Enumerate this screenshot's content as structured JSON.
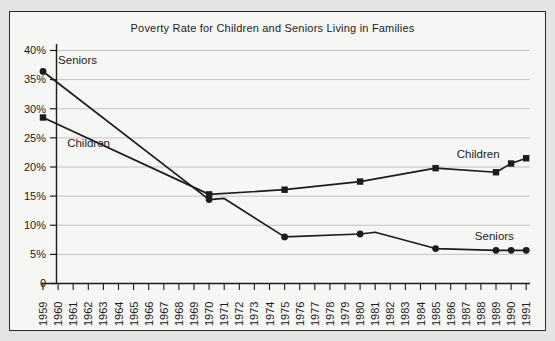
{
  "window": {
    "background": "#e4e4e2",
    "panel_background": "#f6f6f4",
    "border_color": "#2a2a2a"
  },
  "chart_data": {
    "type": "line",
    "title": "Poverty Rate for Children and Seniors Living in Families",
    "xlabel": "",
    "ylabel": "",
    "ylim": [
      0,
      40
    ],
    "grid": true,
    "legend_position": "inline-annotations",
    "y_ticks": [
      {
        "value": 40,
        "label": "40%"
      },
      {
        "value": 35,
        "label": "35%"
      },
      {
        "value": 30,
        "label": "30%"
      },
      {
        "value": 25,
        "label": "25%"
      },
      {
        "value": 20,
        "label": "20%"
      },
      {
        "value": 15,
        "label": "15%"
      },
      {
        "value": 10,
        "label": "10%"
      },
      {
        "value": 5,
        "label": "5%"
      },
      {
        "value": 0,
        "label": "0"
      }
    ],
    "x_tick_labels": [
      "1959",
      "1960",
      "1961",
      "1962",
      "1963",
      "1964",
      "1965",
      "1966",
      "1967",
      "1968",
      "1969",
      "1970",
      "1971",
      "1972",
      "1973",
      "1974",
      "1975",
      "1976",
      "1977",
      "1978",
      "1979",
      "1980",
      "1981",
      "1982",
      "1983",
      "1984",
      "1985",
      "1986",
      "1987",
      "1988",
      "1989",
      "1990",
      "1991"
    ],
    "series": [
      {
        "name": "Seniors",
        "marker": "circle",
        "points": [
          {
            "year": 1959,
            "value": 36.4
          },
          {
            "year": 1970,
            "value": 14.4
          },
          {
            "year": 1971,
            "value": 14.6,
            "marker": false
          },
          {
            "year": 1975,
            "value": 8.0
          },
          {
            "year": 1980,
            "value": 8.5
          },
          {
            "year": 1981,
            "value": 8.8,
            "marker": false
          },
          {
            "year": 1985,
            "value": 6.0
          },
          {
            "year": 1989,
            "value": 5.7
          },
          {
            "year": 1990,
            "value": 5.7
          },
          {
            "year": 1991,
            "value": 5.7
          }
        ]
      },
      {
        "name": "Children",
        "marker": "square",
        "points": [
          {
            "year": 1959,
            "value": 28.5
          },
          {
            "year": 1970,
            "value": 15.3
          },
          {
            "year": 1975,
            "value": 16.1
          },
          {
            "year": 1980,
            "value": 17.5
          },
          {
            "year": 1985,
            "value": 19.8
          },
          {
            "year": 1989,
            "value": 19.1
          },
          {
            "year": 1990,
            "value": 20.6
          },
          {
            "year": 1991,
            "value": 21.5
          }
        ]
      }
    ],
    "annotations": [
      {
        "text": "Seniors",
        "series": "Seniors",
        "year": 1960.0,
        "value": 37.6
      },
      {
        "text": "Children",
        "series": "Children",
        "year": 1960.6,
        "value": 23.5
      },
      {
        "text": "Children",
        "series": "Children",
        "year": 1986.4,
        "value": 21.5
      },
      {
        "text": "Seniors",
        "series": "Seniors",
        "year": 1987.6,
        "value": 7.4
      }
    ],
    "colors": {
      "line": "#1c1c1c",
      "grid": "#c3c3c3",
      "text": "#1c1c1c"
    }
  }
}
